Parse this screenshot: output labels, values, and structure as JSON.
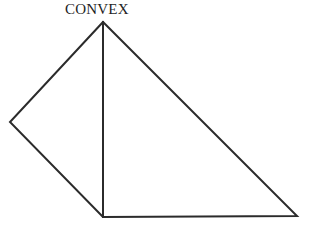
{
  "figure": {
    "label": "CONVEX",
    "label_position": {
      "x": 65,
      "y": 2
    },
    "background_color": "#ffffff",
    "stroke_color": "#2b2b2b",
    "stroke_width": 2,
    "canvas": {
      "width": 310,
      "height": 231
    },
    "vertices": [
      {
        "name": "apex",
        "x": 103,
        "y": 22
      },
      {
        "name": "left",
        "x": 10,
        "y": 122
      },
      {
        "name": "bottom-left",
        "x": 103,
        "y": 217
      },
      {
        "name": "bottom-right",
        "x": 297,
        "y": 216
      }
    ],
    "outline_path": "M 103 22 L 10 122 L 103 217 L 297 216 Z",
    "diagonal_path": "M 103 22 L 103 217",
    "edges": [
      {
        "name": "upper-left-edge",
        "from": "apex",
        "to": "left"
      },
      {
        "name": "lower-left-edge",
        "from": "left",
        "to": "bottom-left"
      },
      {
        "name": "bottom-edge",
        "from": "bottom-left",
        "to": "bottom-right"
      },
      {
        "name": "right-edge",
        "from": "bottom-right",
        "to": "apex"
      },
      {
        "name": "interior-diagonal",
        "from": "apex",
        "to": "bottom-left"
      }
    ]
  }
}
